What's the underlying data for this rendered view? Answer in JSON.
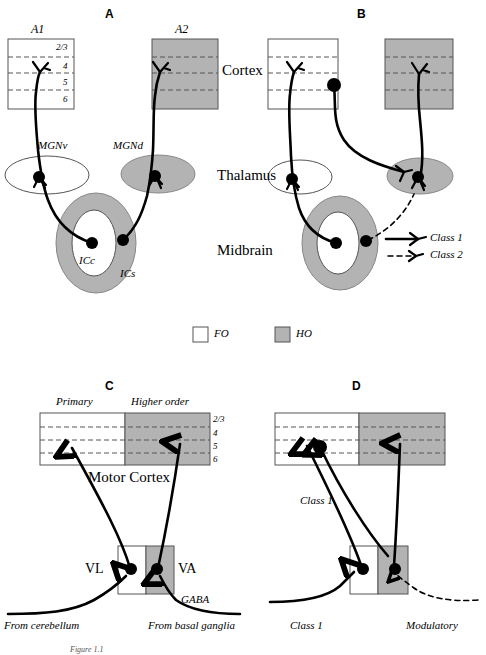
{
  "figure": {
    "caption_partial": "Figure 1.1"
  },
  "panels": [
    {
      "id": "A",
      "letter": "A"
    },
    {
      "id": "B",
      "letter": "B"
    },
    {
      "id": "C",
      "letter": "C"
    },
    {
      "id": "D",
      "letter": "D"
    }
  ],
  "panelA": {
    "letter": "A",
    "cortex_boxes": [
      {
        "name": "A1",
        "type": "FO",
        "fill": "white"
      },
      {
        "name": "A2",
        "type": "HO",
        "fill": "gray"
      }
    ],
    "layers": [
      "2/3",
      "4",
      "5",
      "6"
    ],
    "thalamus_nuclei": [
      {
        "name": "MGNv",
        "type": "FO",
        "fill": "white"
      },
      {
        "name": "MGNd",
        "type": "HO",
        "fill": "gray"
      }
    ],
    "midbrain_structures": [
      {
        "name": "ICc",
        "type": "FO",
        "fill": "white"
      },
      {
        "name": "ICs",
        "type": "HO",
        "fill": "gray"
      }
    ]
  },
  "panelB": {
    "letter": "B",
    "cortex_boxes": [
      {
        "name": "",
        "type": "FO",
        "fill": "white"
      },
      {
        "name": "",
        "type": "HO",
        "fill": "gray"
      }
    ],
    "thalamus_nuclei": [
      {
        "type": "FO",
        "fill": "white"
      },
      {
        "type": "HO",
        "fill": "gray"
      }
    ],
    "midbrain_structures": [
      {
        "type": "FO",
        "fill": "white"
      },
      {
        "type": "HO",
        "fill": "gray"
      }
    ],
    "legend": [
      {
        "label": "Class 1",
        "style": "solid"
      },
      {
        "label": "Class 2",
        "style": "dashed"
      }
    ]
  },
  "panelC": {
    "letter": "C",
    "column_labels": [
      "Primary",
      "Higher order"
    ],
    "cortex_name": "Motor Cortex",
    "layers": [
      "2/3",
      "4",
      "5",
      "6"
    ],
    "thalamus_nuclei": [
      {
        "name": "VL",
        "type": "FO",
        "fill": "white"
      },
      {
        "name": "VA",
        "type": "HO",
        "fill": "gray"
      }
    ],
    "inputs": [
      {
        "label": "From cerebellum",
        "style": "solid"
      },
      {
        "label": "From basal ganglia",
        "style": "solid"
      }
    ],
    "transmitter_label": "GABA"
  },
  "panelD": {
    "letter": "D",
    "cortex_boxes": [
      {
        "type": "FO",
        "fill": "white"
      },
      {
        "type": "HO",
        "fill": "gray"
      }
    ],
    "annotations": [
      {
        "label": "Class 1",
        "position": "cortex-projection"
      },
      {
        "label": "Class 1",
        "position": "ascending-input"
      },
      {
        "label": "Modulatory",
        "position": "dashed-input"
      }
    ],
    "thalamus_nuclei": [
      {
        "type": "FO",
        "fill": "white"
      },
      {
        "type": "HO",
        "fill": "gray"
      }
    ]
  },
  "region_labels": [
    {
      "name": "Cortex"
    },
    {
      "name": "Thalamus"
    },
    {
      "name": "Midbrain"
    }
  ],
  "key_legend": [
    {
      "label": "FO",
      "fill": "white",
      "meaning": "first order"
    },
    {
      "label": "HO",
      "fill": "gray",
      "meaning": "higher order"
    }
  ],
  "colors": {
    "ho_gray": "#b3b3b3",
    "fo_white": "#ffffff",
    "stroke": "#000000",
    "dash": "#555555"
  }
}
